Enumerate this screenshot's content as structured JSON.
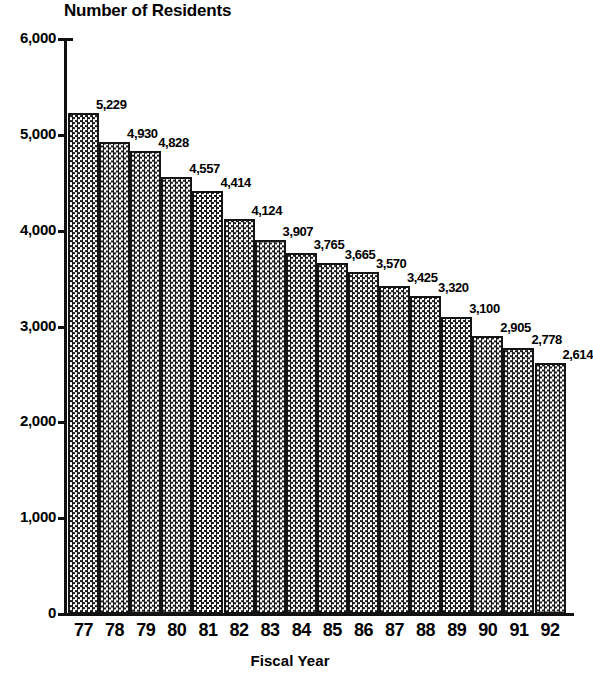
{
  "chart_data": {
    "type": "bar",
    "title": "Number of Residents",
    "xlabel": "Fiscal Year",
    "ylabel": "",
    "categories": [
      "77",
      "78",
      "79",
      "80",
      "81",
      "82",
      "83",
      "84",
      "85",
      "86",
      "87",
      "88",
      "89",
      "90",
      "91",
      "92"
    ],
    "values": [
      5229,
      4930,
      4828,
      4557,
      4414,
      4124,
      3907,
      3765,
      3665,
      3570,
      3425,
      3320,
      3100,
      2905,
      2778,
      2614
    ],
    "value_labels": [
      "5,229",
      "4,930",
      "4,828",
      "4,557",
      "4,414",
      "4,124",
      "3,907",
      "3,765",
      "3,665",
      "3,570",
      "3,425",
      "3,320",
      "3,100",
      "2,905",
      "2,778",
      "2,614"
    ],
    "ylim": [
      0,
      6000
    ],
    "y_ticks": [
      0,
      1000,
      2000,
      3000,
      4000,
      5000,
      6000
    ],
    "y_tick_labels": [
      "0",
      "1,000",
      "2,000",
      "3,000",
      "4,000",
      "5,000",
      "6,000"
    ],
    "grid": false,
    "legend": "none",
    "bar_fill": "#3d3d3d",
    "bar_outline": "#141414",
    "background": "#ffffff"
  }
}
